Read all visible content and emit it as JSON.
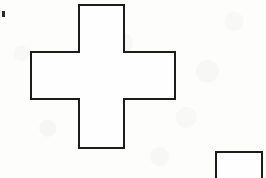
{
  "canvas": {
    "width": 266,
    "height": 178,
    "background_color": "#fdfdfb",
    "media": "scanned-paper",
    "description": "Black line drawing on white paper: a plus/cross shaped polygon at center-left and a partially visible rectangle clipped at the bottom-right corner"
  },
  "style": {
    "stroke_color": "#1c1c1c",
    "stroke_width": 2,
    "fill_color": "#fefefe"
  },
  "figures": [
    {
      "id": "cross",
      "name": "plus-cross-polygon",
      "type": "polygon",
      "vertex_count": 12,
      "points": "79,5 124,5 124,52 175,52 175,99 124,99 124,148 79,148 79,99 31,99 31,52 79,52",
      "bounds": {
        "x": 31,
        "y": 5,
        "width": 144,
        "height": 143
      },
      "arms": {
        "top": {
          "x": 79,
          "y": 5,
          "width": 45,
          "height": 47
        },
        "bottom": {
          "x": 79,
          "y": 99,
          "width": 45,
          "height": 49
        },
        "left": {
          "x": 31,
          "y": 52,
          "width": 48,
          "height": 47
        },
        "right": {
          "x": 124,
          "y": 52,
          "width": 51,
          "height": 47
        }
      },
      "center_square": {
        "x": 79,
        "y": 52,
        "width": 45,
        "height": 47
      }
    },
    {
      "id": "corner-rectangle",
      "name": "clipped-rectangle",
      "type": "rectangle",
      "points": "216,152 262,152 262,180 216,180",
      "bounds": {
        "x": 216,
        "y": 152,
        "width": 46,
        "height": 26
      },
      "clipped_edge": "bottom"
    }
  ],
  "artifacts": [
    {
      "id": "speck",
      "name": "ink-speck",
      "type": "mark",
      "x": 2,
      "y": 11,
      "width": 3,
      "height": 6
    }
  ]
}
